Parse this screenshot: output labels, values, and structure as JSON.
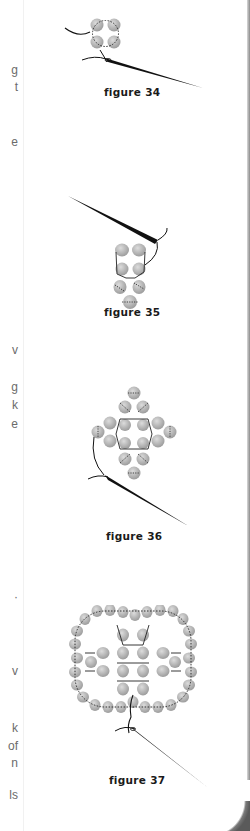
{
  "page": {
    "background": "#ffffff",
    "text_color": "#6b6b6b",
    "caption_color": "#1a1a1a",
    "bead_color": "#b8b8b8"
  },
  "left_column_fragments": [
    {
      "text": "g",
      "y": 70
    },
    {
      "text": "t",
      "y": 87
    },
    {
      "text": "e",
      "y": 142
    },
    {
      "text": "v",
      "y": 350
    },
    {
      "text": "g",
      "y": 387
    },
    {
      "text": "k",
      "y": 405
    },
    {
      "text": "e",
      "y": 424
    },
    {
      "text": "·",
      "y": 597
    },
    {
      "text": "v",
      "y": 671
    },
    {
      "text": "k",
      "y": 728
    },
    {
      "text": "of",
      "y": 746
    },
    {
      "text": "n",
      "y": 763
    },
    {
      "text": "ls",
      "y": 795
    }
  ],
  "figures": [
    {
      "id": "34",
      "caption": "figure 34",
      "description": "four-bead square with thread and needle"
    },
    {
      "id": "35",
      "caption": "figure 35",
      "description": "seven-bead vertical unit with needle above"
    },
    {
      "id": "36",
      "caption": "figure 36",
      "description": "diamond cross bead pattern with needle"
    },
    {
      "id": "37",
      "caption": "figure 37",
      "description": "large square ring of beads with inner cross, needle below"
    }
  ]
}
